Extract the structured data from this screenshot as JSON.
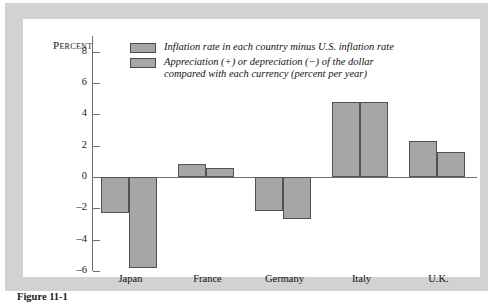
{
  "figure": {
    "caption": "Figure 11-1"
  },
  "legend": {
    "position": "top-inside",
    "entries": [
      {
        "swatch_name": "legend-swatch-inflation-differential",
        "label": "Inflation rate in each country minus U.S. inflation rate",
        "color": "#a6a6a6"
      },
      {
        "swatch_name": "legend-swatch-dollar-appreciation",
        "label": "Appreciation (+) or depreciation (−) of the dollar\ncompared with each currency (percent per year)",
        "color": "#a6a6a6"
      }
    ]
  },
  "chart_data": {
    "type": "bar",
    "title": "",
    "xlabel": "",
    "ylabel": "Percent",
    "ylim": [
      -6,
      9
    ],
    "grid": false,
    "zero_line": true,
    "categories": [
      "Japan",
      "France",
      "Germany",
      "Italy",
      "U.K."
    ],
    "y_ticks": [
      8,
      6,
      4,
      2,
      0,
      -2,
      -4,
      -6
    ],
    "y_tick_labels": [
      "8",
      "6",
      "4",
      "2",
      "0",
      "–2",
      "–4",
      "–6"
    ],
    "series": [
      {
        "name": "Inflation rate in each country minus U.S. inflation rate",
        "color": "#a6a6a6",
        "values": [
          -2.3,
          0.85,
          -2.2,
          4.8,
          2.3
        ]
      },
      {
        "name": "Appreciation (+) or depreciation (−) of the dollar compared with each currency (percent per year)",
        "color": "#a6a6a6",
        "values": [
          -5.8,
          0.6,
          -2.7,
          4.8,
          1.6
        ]
      }
    ]
  }
}
